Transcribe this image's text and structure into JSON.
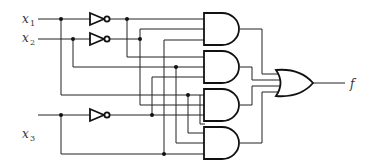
{
  "diagram": {
    "type": "logic-circuit",
    "inputs": [
      {
        "name": "x",
        "sub": "1"
      },
      {
        "name": "x",
        "sub": "2"
      },
      {
        "name": "x",
        "sub": "3"
      }
    ],
    "output": {
      "name": "f"
    },
    "gates": {
      "not": 3,
      "and": 4,
      "or": 1
    }
  }
}
